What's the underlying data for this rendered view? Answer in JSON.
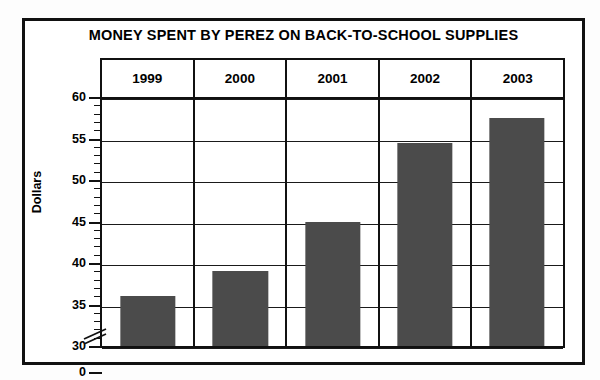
{
  "chart_data": {
    "type": "bar",
    "title": "MONEY SPENT BY PEREZ ON BACK-TO-SCHOOL SUPPLIES",
    "xlabel": "",
    "ylabel": "Dollars",
    "categories": [
      "1999",
      "2000",
      "2001",
      "2002",
      "2003"
    ],
    "values": [
      36,
      39,
      45,
      54.5,
      57.5
    ],
    "ylim": [
      30,
      60
    ],
    "y_axis_break": true,
    "y_break_from": 0,
    "y_break_to": 30,
    "y_ticks": [
      60,
      55,
      50,
      45,
      40,
      35,
      30,
      0
    ],
    "y_tick_labels": [
      "60",
      "55",
      "50",
      "45",
      "40",
      "35",
      "30",
      "0"
    ],
    "y_minor_tick_step": 1,
    "grid": true,
    "grid_axis": "y",
    "legend": false,
    "bar_color": "#4b4b4b",
    "series": [
      {
        "name": "Dollars spent",
        "values": [
          36,
          39,
          45,
          54.5,
          57.5
        ]
      }
    ],
    "points": [
      {
        "category": "1999",
        "value": 36
      },
      {
        "category": "2000",
        "value": 39
      },
      {
        "category": "2001",
        "value": 45
      },
      {
        "category": "2002",
        "value": 54.5
      },
      {
        "category": "2003",
        "value": 57.5
      }
    ]
  },
  "chart": {
    "title": "MONEY SPENT BY PEREZ ON BACK-TO-SCHOOL SUPPLIES",
    "y_axis_caption": "Dollars"
  }
}
